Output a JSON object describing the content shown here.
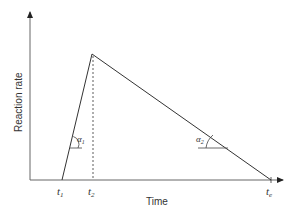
{
  "diagram": {
    "type": "line",
    "axes": {
      "xlabel": "Time",
      "ylabel": "Reaction rate"
    },
    "points": [
      {
        "label": "t1",
        "main": "t",
        "sub": "1"
      },
      {
        "label": "t2",
        "main": "t",
        "sub": "2"
      },
      {
        "label": "te",
        "main": "t",
        "sub": "e"
      }
    ],
    "angles": [
      {
        "label": "α1",
        "main": "α",
        "sub": "1"
      },
      {
        "label": "α2",
        "main": "α",
        "sub": "2"
      }
    ],
    "colors": {
      "line": "#333333",
      "axis": "#555555"
    }
  }
}
